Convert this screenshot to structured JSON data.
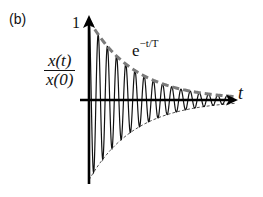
{
  "panel_label": "(b)",
  "y_axis": {
    "label_num": "x(t)",
    "label_den": "x(0)",
    "tick_label": "1"
  },
  "x_axis": {
    "label": "t"
  },
  "envelope_label": {
    "base": "e",
    "exponent": "−t/T"
  },
  "chart_data": {
    "type": "line",
    "title": "",
    "xlabel": "t",
    "ylabel": "x(t)/x(0)",
    "annotations": [
      "e^{-t/T}",
      "1"
    ],
    "series": [
      {
        "name": "x(t)/x(0) damped oscillation",
        "style": "solid",
        "function": "exp(-t/T)*cos(2*pi*t/P)",
        "T": 1.0,
        "P": 0.065
      },
      {
        "name": "upper envelope e^{-t/T}",
        "style": "dashed-thick-gray",
        "function": "exp(-t/T)"
      },
      {
        "name": "lower envelope -e^{-t/T}",
        "style": "dashed-thin",
        "function": "-exp(-t/T)"
      }
    ],
    "xlim": [
      0,
      1.0
    ],
    "ylim": [
      -1,
      1
    ],
    "grid": false,
    "legend": "none"
  },
  "geometry": {
    "x0": 89,
    "y0": 100,
    "xEnd": 236,
    "yTop": 20,
    "amp": 80,
    "period": 9.2,
    "tau": 46
  }
}
